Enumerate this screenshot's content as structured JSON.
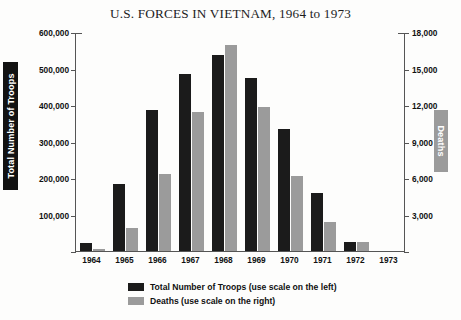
{
  "chart_data": {
    "type": "bar",
    "title": "U.S. FORCES IN VIETNAM, 1964 to 1973",
    "xlabel": "",
    "categories": [
      "1964",
      "1965",
      "1966",
      "1967",
      "1968",
      "1969",
      "1970",
      "1971",
      "1972",
      "1973"
    ],
    "grid": false,
    "legend_position": "bottom-center",
    "axes": {
      "left": {
        "label": "Total Number of Troops",
        "ylim": [
          0,
          600000
        ],
        "tick_step": 100000,
        "ticks": [
          0,
          100000,
          200000,
          300000,
          400000,
          500000,
          600000
        ],
        "tick_labels": [
          "",
          "100,000",
          "200,000",
          "300,000",
          "400,000",
          "500,000",
          "600,000"
        ]
      },
      "right": {
        "label": "Deaths",
        "ylim": [
          0,
          18000
        ],
        "tick_step": 3000,
        "ticks": [
          0,
          3000,
          6000,
          9000,
          12000,
          15000,
          18000
        ],
        "tick_labels": [
          "",
          "3,000",
          "6,000",
          "9,000",
          "12,000",
          "15,000",
          "18,000"
        ]
      }
    },
    "series": [
      {
        "name": "Total Number of Troops (use scale on the left)",
        "short_name": "Total Number of Troops",
        "axis": "left",
        "color": "#1b1b1b",
        "values": [
          23000,
          184000,
          385000,
          486000,
          536000,
          475000,
          335000,
          158000,
          24000,
          0
        ]
      },
      {
        "name": "Deaths (use scale on the right)",
        "short_name": "Deaths",
        "axis": "right",
        "color": "#9b9b9b",
        "values": [
          200,
          1900,
          6350,
          11400,
          16900,
          11800,
          6200,
          2400,
          760,
          0
        ]
      }
    ]
  },
  "legend": {
    "items": [
      {
        "label": "Total Number of Troops (use scale on the left)",
        "color": "#1b1b1b"
      },
      {
        "label": "Deaths (use scale on the right)",
        "color": "#9b9b9b"
      }
    ]
  }
}
